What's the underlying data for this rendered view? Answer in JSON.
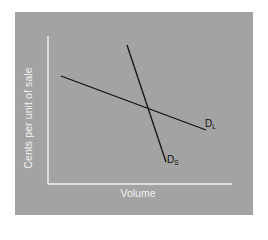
{
  "diagram": {
    "background_color": "#a3a3a3",
    "axis_color": "#f2f2f2",
    "line_color": "#111111",
    "y_axis_label": "Cents per unit of sale",
    "x_axis_label": "Volume",
    "curves": [
      {
        "name": "D",
        "subscript": "L",
        "x1": 61,
        "y1": 76,
        "x2": 206,
        "y2": 130
      },
      {
        "name": "D",
        "subscript": "S",
        "x1": 127,
        "y1": 45,
        "x2": 166,
        "y2": 162
      }
    ]
  }
}
